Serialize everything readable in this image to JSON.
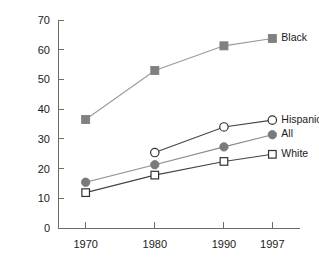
{
  "chart_data": {
    "type": "line",
    "title": "",
    "subtitle": "",
    "xlabel": "",
    "ylabel": "",
    "x": [
      1970,
      1980,
      1990,
      1997
    ],
    "xtick_labels": [
      "1970",
      "1980",
      "1990",
      "1997"
    ],
    "ytick_labels": [
      "0",
      "10",
      "20",
      "30",
      "40",
      "50",
      "60",
      "70"
    ],
    "yticks": [
      0,
      10,
      20,
      30,
      40,
      50,
      60,
      70
    ],
    "ylim": [
      0,
      70
    ],
    "xlim": [
      1966,
      2001
    ],
    "grid": false,
    "legend_position": "right-inline-end-of-line",
    "series": [
      {
        "name": "Black",
        "label": "Black",
        "marker": "filled-square",
        "color": "#808080",
        "line_color": "#9a9a9a",
        "x": [
          1970,
          1980,
          1990,
          1997
        ],
        "values": [
          36.5,
          53.0,
          61.3,
          63.8
        ]
      },
      {
        "name": "Hispanic",
        "label": "Hispanic",
        "marker": "open-circle",
        "color": "#333333",
        "line_color": "#444444",
        "x": [
          1980,
          1990,
          1997
        ],
        "values": [
          25.4,
          34.0,
          36.3
        ]
      },
      {
        "name": "All",
        "label": "All",
        "marker": "filled-circle",
        "color": "#7a7a7a",
        "line_color": "#8c8c8c",
        "x": [
          1970,
          1980,
          1990,
          1997
        ],
        "values": [
          15.4,
          21.3,
          27.3,
          31.4
        ]
      },
      {
        "name": "White",
        "label": "White",
        "marker": "open-square",
        "color": "#333333",
        "line_color": "#444444",
        "x": [
          1970,
          1980,
          1990,
          1997
        ],
        "values": [
          11.9,
          17.8,
          22.4,
          24.8
        ]
      }
    ]
  },
  "axes": {
    "y_axis_name": "y-axis",
    "x_axis_name": "x-axis"
  }
}
